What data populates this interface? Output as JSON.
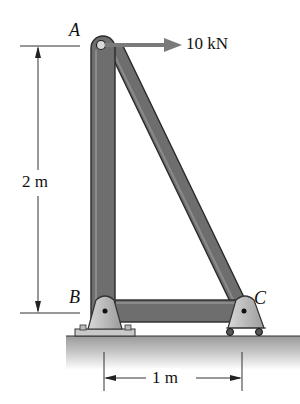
{
  "diagram": {
    "type": "truss-frame",
    "points": {
      "A": {
        "label": "A"
      },
      "B": {
        "label": "B"
      },
      "C": {
        "label": "C"
      }
    },
    "load": {
      "label": "10 kN",
      "direction": "right",
      "applied_at": "A"
    },
    "dimensions": {
      "vertical": {
        "label": "2 m",
        "from": "A",
        "to": "B"
      },
      "horizontal": {
        "label": "1 m",
        "from": "B",
        "to": "C"
      }
    },
    "supports": {
      "B": "pin",
      "C": "roller"
    },
    "colors": {
      "member": "#6e6e6e",
      "member_edge": "#2a2a2a",
      "support": "#b4b4b4",
      "ground": "#c8c8c8",
      "load_arrow": "#7a7a7a"
    }
  }
}
